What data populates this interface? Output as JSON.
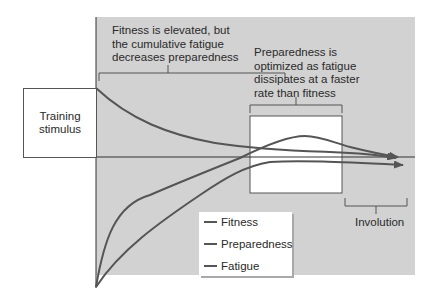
{
  "diagram": {
    "type": "fitness-fatigue-model",
    "annotations": {
      "elevated": "Fitness is elevated, but the cumulative fatigue decreases preparedness",
      "elevated_lines": [
        "Fitness is elevated, but",
        "the cumulative fatigue",
        "decreases preparedness"
      ],
      "optimized_lines": [
        "Preparedness is",
        "optimized as fatigue",
        "dissipates at a faster",
        "rate than fitness"
      ],
      "involution": "Involution"
    },
    "stimulus_box": {
      "lines": [
        "Training",
        "stimulus"
      ]
    },
    "legend": {
      "items": [
        {
          "label": "Fitness"
        },
        {
          "label": "Preparedness"
        },
        {
          "label": "Fatigue"
        }
      ]
    },
    "colors": {
      "panel": "#d2d2d2",
      "curve": "#555555",
      "axis": "#333333",
      "highlight_box": "#ffffff"
    },
    "curves": [
      {
        "name": "Fatigue",
        "description": "starts high at training stimulus, decays toward baseline"
      },
      {
        "name": "Fitness",
        "description": "rises quickly, peaks above baseline in preparedness window, then declines"
      },
      {
        "name": "Preparedness",
        "description": "rises from low, approaches baseline, then involution"
      }
    ]
  }
}
